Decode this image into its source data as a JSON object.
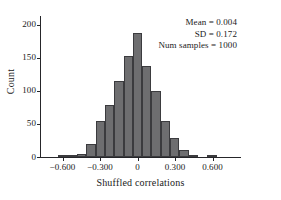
{
  "chart_data": {
    "type": "bar",
    "title": "",
    "xlabel": "Shuffled correlations",
    "ylabel": "Count",
    "xlim": [
      -0.78,
      0.82
    ],
    "ylim": [
      0,
      210
    ],
    "grid": false,
    "legend": "none",
    "bin_width": 0.0745,
    "x_ticks": [
      -0.6,
      -0.3,
      0,
      0.3,
      0.6
    ],
    "x_tick_labels": [
      "−0.600",
      "−0.300",
      "0",
      "0.300",
      "0.600"
    ],
    "y_ticks": [
      0,
      50,
      100,
      150,
      200
    ],
    "y_tick_labels": [
      "0",
      "50",
      "100",
      "150",
      "200"
    ],
    "bar_color": "#6e6e70",
    "bar_edge_color": "#3b3b3e",
    "axis_color": "#26262a",
    "bin_centers": [
      -0.595,
      -0.521,
      -0.447,
      -0.372,
      -0.298,
      -0.223,
      -0.149,
      -0.074,
      0.0,
      0.074,
      0.149,
      0.223,
      0.298,
      0.372,
      0.447,
      0.521,
      0.595
    ],
    "values": [
      1,
      2,
      4,
      20,
      54,
      78,
      115,
      152,
      188,
      138,
      100,
      55,
      28,
      10,
      2,
      0,
      1
    ],
    "annotations": [
      "Mean = 0.004",
      "SD = 0.172",
      "Num samples = 1000"
    ],
    "stats": {
      "mean": 0.004,
      "sd": 0.172,
      "num_samples": 1000
    }
  }
}
